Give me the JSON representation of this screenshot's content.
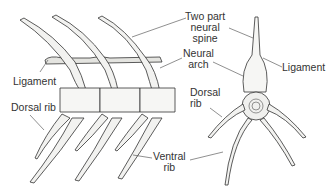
{
  "diagram": {
    "labels": {
      "two_part_neural_spine": [
        "Two part",
        "neural",
        "spine"
      ],
      "neural_arch": [
        "Neural",
        "arch"
      ],
      "ligament_left": "Ligament",
      "ligament_right": "Ligament",
      "dorsal_rib_left": "Dorsal rib",
      "dorsal_rib_right": [
        "Dorsal",
        "rib"
      ],
      "ventral_rib": [
        "Ventral",
        "rib"
      ]
    },
    "colors": {
      "line": "#333333",
      "bone": "#f2f2f0",
      "shade": "#c8c8c4"
    }
  }
}
